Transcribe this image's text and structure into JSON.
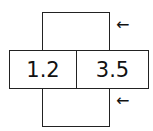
{
  "diagram": {
    "cells": [
      {
        "label": "1.2"
      },
      {
        "label": "3.5"
      }
    ],
    "arrows": [
      {
        "glyph": "←"
      },
      {
        "glyph": "←"
      }
    ]
  }
}
